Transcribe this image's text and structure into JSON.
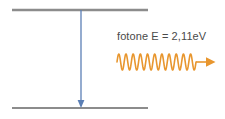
{
  "diagram": {
    "type": "energy-level-transition",
    "background_color": "#ffffff",
    "levels": [
      {
        "name": "upper-energy-level",
        "label": "",
        "color": "#8c8c8c",
        "x1": 12,
        "x2": 148,
        "y": 10,
        "thickness": 2.4
      },
      {
        "name": "lower-energy-level",
        "label": "",
        "color": "#8c8c8c",
        "x1": 12,
        "x2": 148,
        "y": 108,
        "thickness": 2.0
      }
    ],
    "transition_arrow": {
      "name": "downward-transition-arrow",
      "color": "#5b7fb5",
      "x": 81,
      "y_start": 10,
      "y_end": 108,
      "direction": "down",
      "thickness": 1.3
    },
    "photon": {
      "label": "fotone E = 2,11eV",
      "energy_value": "2,11",
      "energy_unit": "eV",
      "label_color": "#4a4a4a",
      "wave": {
        "name": "photon-wave-arrow",
        "color": "#e8962e",
        "x_start": 117,
        "x_end": 196,
        "y_center": 62,
        "amplitude": 8,
        "cycles": 11,
        "thickness": 1.6,
        "arrow_tip_x": 214
      }
    }
  },
  "chart_data": {
    "type": "diagram",
    "title": "",
    "annotations": [
      "fotone E = 2,11eV"
    ],
    "series": [
      {
        "name": "energy-levels",
        "values": [
          "upper",
          "lower"
        ]
      }
    ]
  }
}
